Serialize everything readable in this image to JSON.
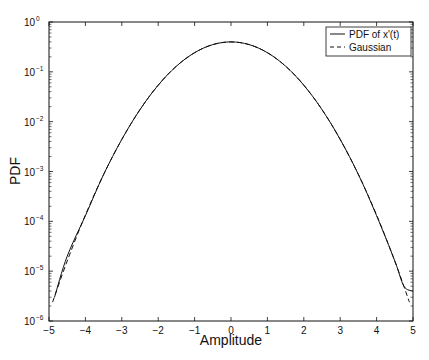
{
  "chart_data": {
    "type": "line",
    "title": "",
    "xlabel": "Amplitude",
    "ylabel": "PDF",
    "xlim": [
      -5,
      5
    ],
    "ylim": [
      1e-06,
      1
    ],
    "yscale": "log",
    "grid": false,
    "legend_position": "upper right",
    "x_ticks": [
      "-5",
      "-4",
      "-3",
      "-2",
      "-1",
      "0",
      "1",
      "2",
      "3",
      "4",
      "5"
    ],
    "y_ticks": [
      "10^0",
      "10^-1",
      "10^-2",
      "10^-3",
      "10^-4",
      "10^-5",
      "10^-6"
    ],
    "series": [
      {
        "name": "PDF of x'(t)",
        "style": "solid",
        "x": [
          -4.85,
          -4.5,
          -4.0,
          -3.5,
          -3.0,
          -2.5,
          -2.0,
          -1.5,
          -1.0,
          -0.5,
          0,
          0.5,
          1.0,
          1.5,
          2.0,
          2.5,
          3.0,
          3.5,
          4.0,
          4.5,
          4.75,
          5.0
        ],
        "y": [
          3e-06,
          2e-05,
          0.00013,
          0.00087,
          0.0044,
          0.0175,
          0.054,
          0.13,
          0.242,
          0.352,
          0.399,
          0.352,
          0.242,
          0.13,
          0.054,
          0.0175,
          0.0044,
          0.00087,
          0.00013,
          1.6e-05,
          5e-06,
          4e-06
        ]
      },
      {
        "name": "Gaussian",
        "style": "dashed",
        "x": [
          -4.9,
          -4.5,
          -4.0,
          -3.5,
          -3.0,
          -2.5,
          -2.0,
          -1.5,
          -1.0,
          -0.5,
          0,
          0.5,
          1.0,
          1.5,
          2.0,
          2.5,
          3.0,
          3.5,
          4.0,
          4.5,
          4.9
        ],
        "y": [
          2.4e-06,
          1.6e-05,
          0.000134,
          0.00087,
          0.0044,
          0.0175,
          0.054,
          0.13,
          0.242,
          0.352,
          0.399,
          0.352,
          0.242,
          0.13,
          0.054,
          0.0175,
          0.0044,
          0.00087,
          0.000134,
          1.6e-05,
          2.4e-06
        ]
      }
    ]
  },
  "legend": {
    "items": [
      {
        "label": "PDF of x'(t)",
        "style": "solid"
      },
      {
        "label": "Gaussian",
        "style": "dashed"
      }
    ]
  },
  "axes": {
    "xlabel": "Amplitude",
    "ylabel": "PDF",
    "x_tick_labels": [
      "-5",
      "-4",
      "-3",
      "-2",
      "-1",
      "0",
      "1",
      "2",
      "3",
      "4",
      "5"
    ],
    "y_tick_mantissa": "10",
    "y_tick_exponents": [
      "0",
      "-1",
      "-2",
      "-3",
      "-4",
      "-5",
      "-6"
    ]
  },
  "colors": {
    "line": "#111111",
    "background": "#ffffff"
  }
}
